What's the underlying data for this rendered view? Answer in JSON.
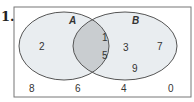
{
  "problem": {
    "number": "1."
  },
  "venn": {
    "sets": [
      {
        "name": "A",
        "elements_only": [
          "2"
        ]
      },
      {
        "name": "B",
        "elements_only": [
          "3",
          "7",
          "9"
        ]
      }
    ],
    "intersection": [
      "1",
      "5"
    ],
    "outside": [
      "8",
      "6",
      "4",
      "0"
    ],
    "colors": {
      "set_fill": "#e9edf0",
      "intersection_fill": "#c9cdd0",
      "stroke": "#555555",
      "border": "#777777"
    }
  },
  "labels": {
    "A": "A",
    "B": "B",
    "a_only_1": "2",
    "ab_1": "1",
    "ab_2": "5",
    "b_only_1": "3",
    "b_only_2": "7",
    "b_only_3": "9",
    "out_1": "8",
    "out_2": "6",
    "out_3": "4",
    "out_4": "0"
  }
}
